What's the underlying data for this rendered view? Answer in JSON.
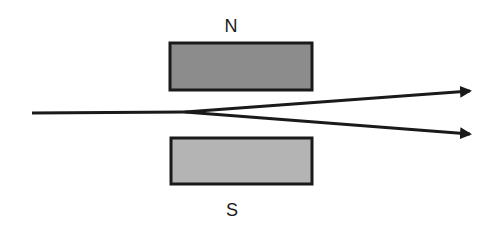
{
  "diagram": {
    "magnets": [
      {
        "label": "N",
        "fill": "#8c8c8c",
        "x": 170,
        "y": 43,
        "width": 142,
        "height": 47
      },
      {
        "label": "S",
        "fill": "#b4b4b4",
        "x": 171,
        "y": 138,
        "width": 141,
        "height": 46
      }
    ],
    "beam": {
      "start": [
        32,
        113
      ],
      "split": [
        185,
        112
      ]
    },
    "arrows": [
      {
        "name": "upper-deflected",
        "end": [
          472,
          91
        ]
      },
      {
        "name": "lower-deflected",
        "end": [
          472,
          134
        ]
      }
    ],
    "stroke_color": "#1a1a1a"
  }
}
